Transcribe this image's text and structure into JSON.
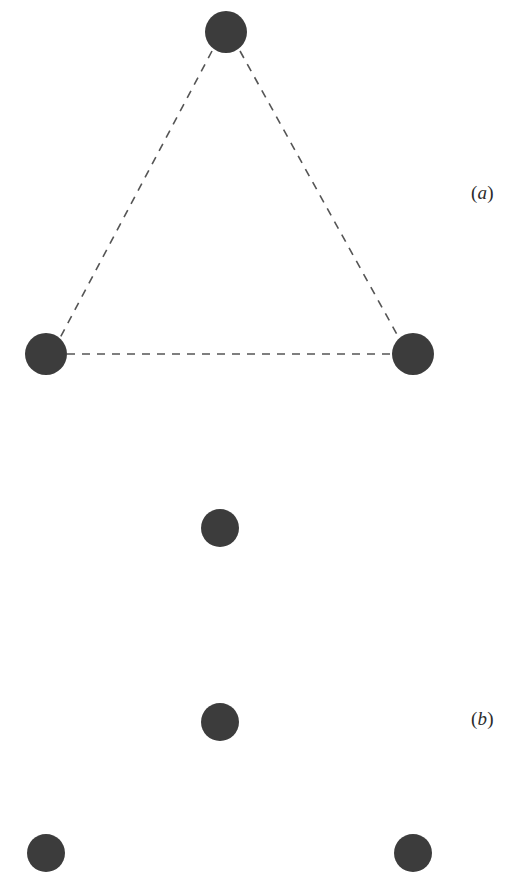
{
  "figure": {
    "width": 513,
    "height": 891,
    "background_color": "#ffffff",
    "node_color": "#3c3c3c",
    "edge_color": "#555555",
    "label_color": "#2b2b2b"
  },
  "panels": [
    {
      "id": "a",
      "label": "(a)",
      "label_open_paren": "(",
      "label_letter": "a",
      "label_close_paren": ")",
      "label_x": 471,
      "label_y": 182,
      "description": "triangle of three nodes joined by dashed edges",
      "nodes": [
        {
          "name": "node-a-top",
          "cx": 226,
          "cy": 32,
          "r": 21
        },
        {
          "name": "node-a-left",
          "cx": 46,
          "cy": 354,
          "r": 21
        },
        {
          "name": "node-a-right",
          "cx": 413,
          "cy": 354,
          "r": 21
        }
      ],
      "edges": [
        {
          "name": "edge-a-top-left",
          "x1": 212,
          "y1": 51,
          "x2": 60,
          "y2": 338
        },
        {
          "name": "edge-a-top-right",
          "x1": 240,
          "y1": 51,
          "x2": 399,
          "y2": 338
        },
        {
          "name": "edge-a-left-right",
          "x1": 67,
          "y1": 354,
          "x2": 392,
          "y2": 354
        }
      ]
    },
    {
      "id": "b",
      "label": "(b)",
      "label_open_paren": "(",
      "label_letter": "b",
      "label_close_paren": ")",
      "label_x": 471,
      "label_y": 708,
      "description": "four nodes with no connecting edges",
      "nodes": [
        {
          "name": "node-b-top",
          "cx": 220,
          "cy": 528,
          "r": 19
        },
        {
          "name": "node-b-middle",
          "cx": 220,
          "cy": 722,
          "r": 19
        },
        {
          "name": "node-b-bottom-left",
          "cx": 46,
          "cy": 853,
          "r": 19
        },
        {
          "name": "node-b-bottom-right",
          "cx": 413,
          "cy": 853,
          "r": 19
        }
      ],
      "edges": []
    }
  ],
  "style": {
    "edge_dash_pattern": "8 7",
    "edge_width": 1.6
  }
}
